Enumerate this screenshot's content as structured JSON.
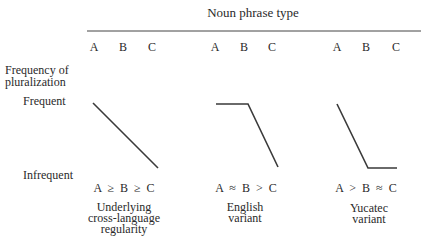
{
  "header": {
    "title": "Noun phrase type",
    "columns": [
      {
        "labels": [
          "A",
          "B",
          "C"
        ]
      },
      {
        "labels": [
          "A",
          "B",
          "C"
        ]
      },
      {
        "labels": [
          "A",
          "B",
          "C"
        ]
      }
    ]
  },
  "y_axis": {
    "title_line1": "Frequency of",
    "title_line2": "pluralization",
    "high_label": "Frequent",
    "low_label": "Infrequent"
  },
  "panels": [
    {
      "formula": "A ≥ B ≥ C",
      "caption_line1": "Underlying",
      "caption_line2": "cross-language",
      "caption_line3": "regularity",
      "shape": "linear decline from A to C"
    },
    {
      "formula": "A ≈ B > C",
      "caption_line1": "English",
      "caption_line2": "variant",
      "shape": "flat from A to B, then decline to C"
    },
    {
      "formula": "A > B ≈ C",
      "caption_line1": "Yucatec",
      "caption_line2": "variant",
      "shape": "decline from A to B, then flat to C"
    }
  ],
  "colors": {
    "line": "#3a3a3a",
    "text": "#2a2a2a"
  }
}
